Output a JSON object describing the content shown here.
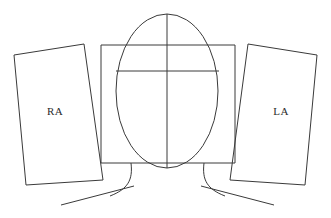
{
  "diagram": {
    "title": "",
    "background_color": "#ffffff",
    "stroke_color": "#3a3a3a",
    "text_color": "#2b2b2b",
    "labels": {
      "right_atrium": "RA",
      "left_atrium": "LA"
    },
    "shapes": {
      "center_ellipse": {
        "name": "center-ellipse",
        "cx": 167,
        "cy": 91,
        "rx": 51,
        "ry": 77
      },
      "center_rectangle": {
        "name": "center-rectangle",
        "x": 101,
        "y": 45,
        "width": 134,
        "height": 118
      },
      "vertical_divider": {
        "name": "vertical-divider",
        "x": 167,
        "y1": 14,
        "y2": 168
      },
      "horizontal_divider": {
        "name": "horizontal-divider",
        "x1": 116,
        "x2": 219,
        "y": 71
      },
      "left_panel": {
        "name": "left-panel-ra",
        "points": "14,55 84,44 103,180 26,185"
      },
      "right_panel": {
        "name": "right-panel-la",
        "points": "248,44 317,55 305,185 230,180"
      },
      "left_curve": {
        "name": "left-vessel-curve",
        "path": "M 131,163 C 133,180 128,189 110,196"
      },
      "right_curve": {
        "name": "right-vessel-curve",
        "path": "M 204,163 C 202,180 207,189 225,196"
      },
      "left_diagonal": {
        "name": "left-vessel-line",
        "x1": 61,
        "y1": 205,
        "x2": 134,
        "y2": 186
      },
      "right_diagonal": {
        "name": "right-vessel-line",
        "x1": 274,
        "y1": 205,
        "x2": 201,
        "y2": 186
      }
    },
    "label_positions": {
      "ra": {
        "x": 55,
        "y": 115
      },
      "la": {
        "x": 281,
        "y": 115
      }
    }
  }
}
